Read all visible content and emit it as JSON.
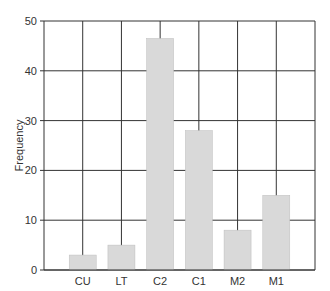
{
  "chart_data": {
    "type": "bar",
    "title": "",
    "xlabel": "",
    "ylabel": "Frequency",
    "categories": [
      "CU",
      "LT",
      "C2",
      "C1",
      "M2",
      "M1"
    ],
    "values": [
      3,
      5,
      46.5,
      28,
      8,
      15
    ],
    "ylim": [
      0,
      50
    ],
    "yticks": [
      0,
      10,
      20,
      30,
      40,
      50
    ],
    "grid": true,
    "legend": null,
    "bar_color": "#d9d9d9",
    "grid_color": "#333333"
  }
}
